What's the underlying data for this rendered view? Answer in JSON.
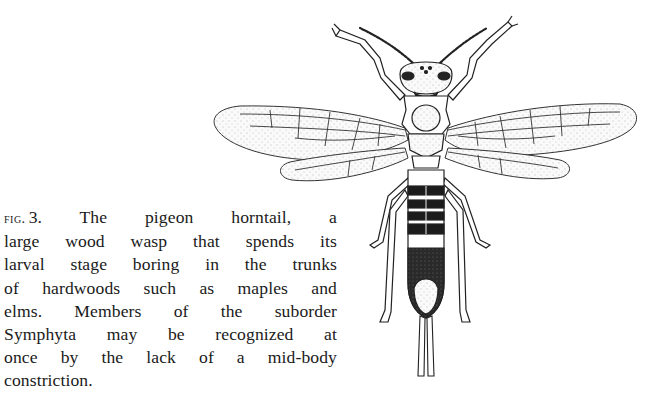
{
  "figure": {
    "label": "fig.",
    "number": "3.",
    "caption_lines": [
      "The pigeon horntail, a",
      "large wood wasp that spends its",
      "larval stage boring in the trunks",
      "of hardwoods such as maples and",
      "elms. Members of the suborder",
      "Symphyta may be recognized at",
      "once by the lack of a mid-body",
      "constriction."
    ],
    "caption_full": "The pigeon horntail, a large wood wasp that spends its larval stage boring in the trunks of hardwoods such as maples and elms. Members of the suborder Symphyta may be recognized at once by the lack of a mid-body constriction."
  },
  "colors": {
    "ink": "#1a1a1a",
    "paper": "#ffffff",
    "wing_fill": "#f3f3f3"
  }
}
